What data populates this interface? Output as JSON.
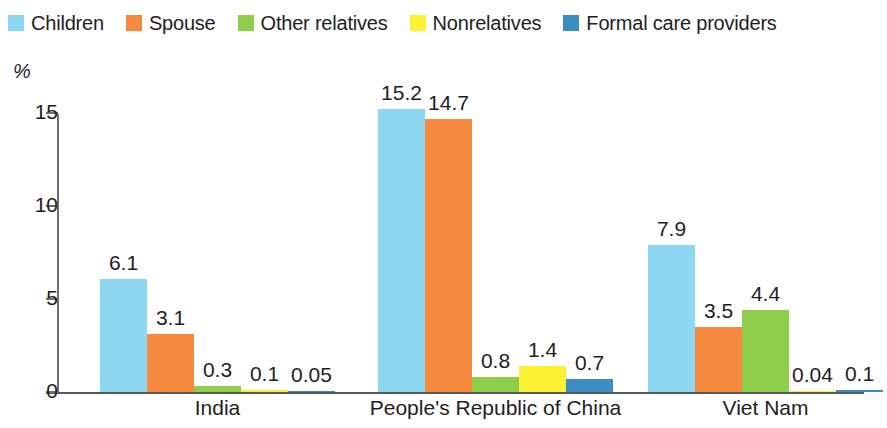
{
  "legend": {
    "items": [
      {
        "label": "Children",
        "color": "#8DD7F0"
      },
      {
        "label": "Spouse",
        "color": "#F58A40"
      },
      {
        "label": "Other relatives",
        "color": "#8FCE4A"
      },
      {
        "label": "Nonrelatives",
        "color": "#FAF232"
      },
      {
        "label": "Formal care providers",
        "color": "#3C8DC4"
      }
    ]
  },
  "axis": {
    "y_unit": "%",
    "y_ticks": [
      "15",
      "10",
      "5",
      "0"
    ]
  },
  "chart_data": {
    "type": "bar",
    "title": "",
    "xlabel": "",
    "ylabel": "%",
    "ylim": [
      0,
      15.8
    ],
    "grid": false,
    "legend_position": "top-left",
    "categories": [
      "India",
      "People's Republic of China",
      "Viet Nam"
    ],
    "series": [
      {
        "name": "Children",
        "color": "#8DD7F0",
        "values": [
          6.1,
          15.2,
          7.9
        ],
        "labels": [
          "6.1",
          "15.2",
          "7.9"
        ]
      },
      {
        "name": "Spouse",
        "color": "#F58A40",
        "values": [
          3.1,
          14.7,
          3.5
        ],
        "labels": [
          "3.1",
          "14.7",
          "3.5"
        ]
      },
      {
        "name": "Other relatives",
        "color": "#8FCE4A",
        "values": [
          0.3,
          0.8,
          4.4
        ],
        "labels": [
          "0.3",
          "0.8",
          "4.4"
        ]
      },
      {
        "name": "Nonrelatives",
        "color": "#FAF232",
        "values": [
          0.1,
          1.4,
          0.04
        ],
        "labels": [
          "0.1",
          "1.4",
          "0.04"
        ]
      },
      {
        "name": "Formal care providers",
        "color": "#3C8DC4",
        "values": [
          0.05,
          0.7,
          0.1
        ],
        "labels": [
          "0.05",
          "0.7",
          "0.1"
        ]
      }
    ]
  }
}
